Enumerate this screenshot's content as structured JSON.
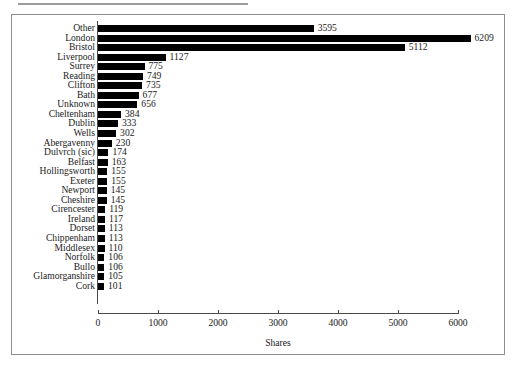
{
  "figure": {
    "background_color": "#ffffff",
    "frame_color": "#8d8d8d",
    "bar_color": "#000000",
    "text_color": "#1b1b1b"
  },
  "chart_data": {
    "type": "bar",
    "orientation": "horizontal",
    "title": "",
    "subtitle": "",
    "xlabel": "Shares",
    "ylabel": "",
    "xlim": [
      0,
      6000
    ],
    "ylim": null,
    "grid": false,
    "legend": null,
    "xticks": [
      0,
      1000,
      2000,
      3000,
      4000,
      5000,
      6000
    ],
    "xtick_labels": [
      "0",
      "1000",
      "2000",
      "3000",
      "4000",
      "5000",
      "6000"
    ],
    "categories": [
      "Other",
      "London",
      "Bristol",
      "Liverpool",
      "Surrey",
      "Reading",
      "Clifton",
      "Bath",
      "Unknown",
      "Cheltenham",
      "Dublin",
      "Wells",
      "Abergavenny",
      "Dulvrch (sic)",
      "Belfast",
      "Hollingsworth",
      "Exeter",
      "Newport",
      "Cheshire",
      "Cirencester",
      "Ireland",
      "Dorset",
      "Chippenham",
      "Middlesex",
      "Norfolk",
      "Bullo",
      "Glamorganshire",
      "Cork"
    ],
    "values": [
      3595,
      6209,
      5112,
      1127,
      775,
      749,
      735,
      677,
      656,
      384,
      333,
      302,
      230,
      174,
      163,
      155,
      155,
      145,
      145,
      119,
      117,
      113,
      113,
      110,
      106,
      106,
      105,
      101
    ],
    "value_labels": [
      "3595",
      "6209",
      "5112",
      "1127",
      "775",
      "749",
      "735",
      "677",
      "656",
      "384",
      "333",
      "302",
      "230",
      "174",
      "163",
      "155",
      "155",
      "145",
      "145",
      "119",
      "117",
      "113",
      "113",
      "110",
      "106",
      "106",
      "105",
      "101"
    ]
  }
}
